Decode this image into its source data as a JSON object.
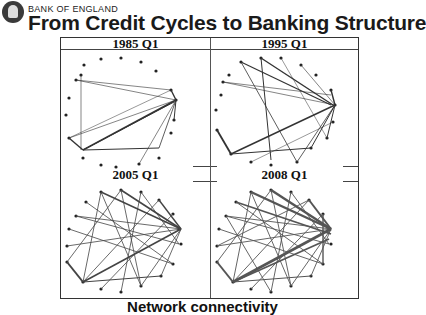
{
  "header": {
    "organization": "BANK OF ENGLAND",
    "title": "From Credit Cycles to Banking Structure"
  },
  "panels": [
    {
      "label": "1985 Q1",
      "density": "sparse"
    },
    {
      "label": "1995 Q1",
      "density": "moderate"
    },
    {
      "label": "2005 Q1",
      "density": "dense"
    },
    {
      "label": "2008 Q1",
      "density": "very dense"
    }
  ],
  "caption": "Network connectivity"
}
